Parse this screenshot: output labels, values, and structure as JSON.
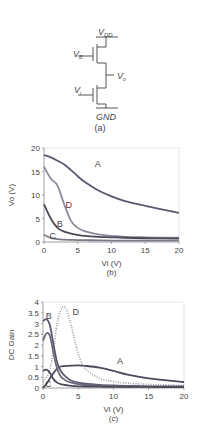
{
  "circuit": {
    "caption": "(a)",
    "labels": {
      "vdd": "V",
      "vdd_sub": "DD",
      "vb": "V",
      "vb_sub": "B",
      "vo": "V",
      "vo_sub": "o",
      "vi": "V",
      "vi_sub": "i",
      "gnd": "GND"
    }
  },
  "chart_data": [
    {
      "type": "line",
      "caption": "(b)",
      "title": "",
      "xlabel": "Vi (V)",
      "ylabel": "Vo (V)",
      "xlim": [
        0,
        20
      ],
      "ylim": [
        0,
        20
      ],
      "xticks": [
        "0",
        "5",
        "10",
        "15",
        "20"
      ],
      "yticks": [
        "0",
        "5",
        "10",
        "15",
        "20"
      ],
      "grid": false,
      "x": [
        0,
        1,
        2,
        3,
        4,
        5,
        6,
        8,
        10,
        12,
        15,
        20
      ],
      "series": [
        {
          "name": "A",
          "values": [
            18.5,
            18.0,
            17.3,
            16.5,
            15.3,
            14.0,
            12.8,
            11.0,
            9.7,
            8.7,
            7.7,
            6.2
          ]
        },
        {
          "name": "D",
          "values": [
            16.0,
            13.5,
            12.0,
            8.0,
            4.5,
            3.0,
            2.3,
            1.6,
            1.3,
            1.1,
            1.0,
            0.9
          ]
        },
        {
          "name": "B",
          "values": [
            8.0,
            5.0,
            3.0,
            2.2,
            1.8,
            1.5,
            1.3,
            1.1,
            1.0,
            0.9,
            0.8,
            0.7
          ]
        },
        {
          "name": "C",
          "values": [
            1.5,
            0.9,
            0.6,
            0.5,
            0.45,
            0.4,
            0.4,
            0.35,
            0.3,
            0.3,
            0.3,
            0.3
          ]
        }
      ]
    },
    {
      "type": "line",
      "caption": "(c)",
      "title": "",
      "xlabel": "Vi (V)",
      "ylabel": "DC Gain",
      "xlim": [
        0,
        20
      ],
      "ylim": [
        0,
        4
      ],
      "xticks": [
        "0",
        "5",
        "10",
        "15",
        "20"
      ],
      "yticks": [
        "0",
        "0.5",
        "1",
        "1.5",
        "2",
        "2.5",
        "3",
        "3.5",
        "4"
      ],
      "grid": false,
      "x": [
        0,
        0.5,
        1,
        1.5,
        2,
        2.5,
        3,
        3.5,
        4,
        5,
        6,
        8,
        10,
        12,
        15,
        20
      ],
      "series": [
        {
          "name": "A",
          "values": [
            0.0,
            0.2,
            0.45,
            0.7,
            0.9,
            1.0,
            1.02,
            1.03,
            1.04,
            1.05,
            1.03,
            0.95,
            0.8,
            0.62,
            0.45,
            0.28
          ]
        },
        {
          "name": "D",
          "values": [
            0.3,
            0.5,
            0.9,
            1.8,
            3.0,
            3.6,
            3.8,
            3.5,
            2.9,
            1.6,
            0.9,
            0.45,
            0.3,
            0.22,
            0.17,
            0.12
          ]
        },
        {
          "name": "B",
          "values": [
            3.1,
            3.2,
            2.9,
            2.0,
            1.2,
            0.8,
            0.6,
            0.45,
            0.35,
            0.25,
            0.2,
            0.15,
            0.12,
            0.1,
            0.08,
            0.07
          ]
        },
        {
          "name": "B2",
          "values": [
            2.2,
            2.55,
            2.4,
            1.6,
            0.9,
            0.55,
            0.4,
            0.3,
            0.25,
            0.18,
            0.14,
            0.1,
            0.08,
            0.07,
            0.06,
            0.05
          ]
        },
        {
          "name": "C",
          "values": [
            0.8,
            0.85,
            0.7,
            0.4,
            0.25,
            0.18,
            0.15,
            0.12,
            0.1,
            0.08,
            0.07,
            0.06,
            0.05,
            0.05,
            0.05,
            0.04
          ]
        }
      ]
    }
  ]
}
